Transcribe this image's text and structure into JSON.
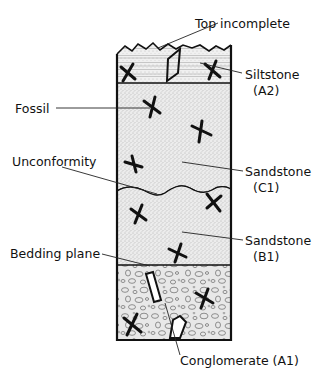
{
  "diagram": {
    "type": "stratigraphic-column",
    "layers": [
      {
        "id": "A2",
        "name": "Siltstone",
        "position": "top",
        "pattern": "horizontal-lines-stipple"
      },
      {
        "id": "C1",
        "name": "Sandstone",
        "position": "upper-middle",
        "pattern": "fine-stipple"
      },
      {
        "id": "B1",
        "name": "Sandstone",
        "position": "lower-middle",
        "pattern": "fine-stipple"
      },
      {
        "id": "A1",
        "name": "Conglomerate",
        "position": "bottom",
        "pattern": "pebbles"
      }
    ],
    "boundaries": [
      {
        "name": "Top incomplete",
        "type": "zigzag"
      },
      {
        "name": "Unconformity",
        "type": "wavy"
      },
      {
        "name": "Bedding plane",
        "type": "straight"
      }
    ]
  },
  "labels": {
    "top_incomplete": "Top incomplete",
    "siltstone": "Siltstone",
    "siltstone_code": "(A2)",
    "fossil": "Fossil",
    "unconformity": "Unconformity",
    "sandstone_c1": "Sandstone",
    "sandstone_c1_code": "(C1)",
    "sandstone_b1": "Sandstone",
    "sandstone_b1_code": "(B1)",
    "bedding_plane": "Bedding plane",
    "conglomerate": "Conglomerate (A1)"
  },
  "colors": {
    "ink": "#111111",
    "fill": "#e6e6e6",
    "background": "#ffffff"
  }
}
